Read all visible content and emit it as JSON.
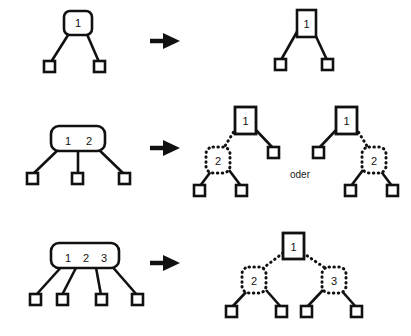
{
  "diagram": {
    "background": "#ffffff",
    "ink": "#111111",
    "connector_label": "oder",
    "arrow_glyph": "right-arrow",
    "rows": [
      {
        "id": "row-1",
        "left": {
          "group_node": {
            "keys": [
              "1"
            ],
            "style": "rounded-solid"
          },
          "leaves": 2
        },
        "right": {
          "variants": [
            {
              "root": "1",
              "root_style": "rect-solid",
              "children": [
                "leaf",
                "leaf"
              ]
            }
          ]
        }
      },
      {
        "id": "row-2",
        "left": {
          "group_node": {
            "keys": [
              "1",
              "2"
            ],
            "style": "rounded-solid"
          },
          "leaves": 3
        },
        "right": {
          "variants": [
            {
              "root": "1",
              "root_style": "rect-solid",
              "inner": "2",
              "inner_style": "rounded-dotted",
              "inner_side": "left",
              "leaves": 3
            },
            {
              "root": "1",
              "root_style": "rect-solid",
              "inner": "2",
              "inner_style": "rounded-dotted",
              "inner_side": "right",
              "leaves": 3
            }
          ],
          "separator": "oder"
        }
      },
      {
        "id": "row-3",
        "left": {
          "group_node": {
            "keys": [
              "1",
              "2",
              "3"
            ],
            "style": "rounded-solid"
          },
          "leaves": 4
        },
        "right": {
          "variants": [
            {
              "root": "1",
              "root_style": "rect-solid",
              "inner_left": "2",
              "inner_right": "3",
              "inner_style": "rounded-dotted",
              "leaves": 4
            }
          ]
        }
      }
    ],
    "labels": {
      "r1_left_key1": "1",
      "r1_right_key1": "1",
      "r2_left_key1": "1",
      "r2_left_key2": "2",
      "r2_rightA_root": "1",
      "r2_rightA_inner": "2",
      "r2_rightB_root": "1",
      "r2_rightB_inner": "2",
      "r3_left_key1": "1",
      "r3_left_key2": "2",
      "r3_left_key3": "3",
      "r3_right_root": "1",
      "r3_right_inner_left": "2",
      "r3_right_inner_right": "3",
      "oder": "oder"
    }
  }
}
